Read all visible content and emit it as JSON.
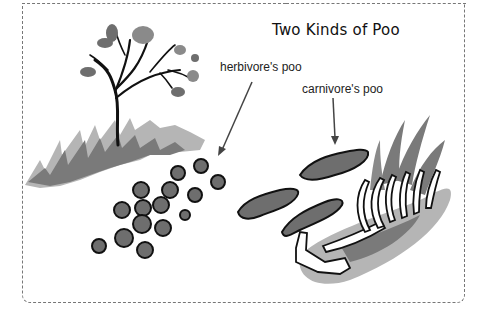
{
  "title": "Two Kinds of Poo",
  "labels": {
    "herbivore": "herbivore's poo",
    "carnivore": "carnivore's poo"
  },
  "colors": {
    "border": "#777777",
    "grass_light": "#b5b5b5",
    "grass_dark": "#7a7a7a",
    "poo_fill": "#6e6e6e",
    "poo_outline": "#111111",
    "bone_fill": "#ffffff"
  },
  "illustration": {
    "elements": [
      "tree",
      "grass-mound-left",
      "herbivore-pellets",
      "carnivore-droppings",
      "animal-skeleton",
      "grass-clump-right"
    ]
  }
}
